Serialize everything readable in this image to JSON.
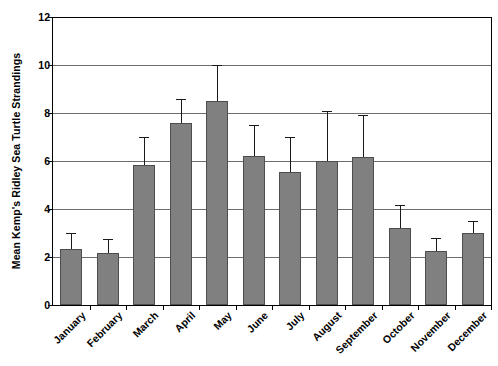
{
  "chart_data": {
    "type": "bar",
    "title": "",
    "xlabel": "",
    "ylabel": "Mean Kemp's Ridley Sea Turtle Strandings",
    "ylim": [
      0,
      12
    ],
    "yticks": [
      0,
      2,
      4,
      6,
      8,
      10,
      12
    ],
    "ytick_labels": [
      "0",
      "2",
      "4",
      "6",
      "8",
      "10",
      "12"
    ],
    "grid": true,
    "legend": "none",
    "error_bars": "upper-only",
    "categories": [
      "January",
      "February",
      "March",
      "April",
      "May",
      "June",
      "July",
      "August",
      "September",
      "October",
      "November",
      "December"
    ],
    "values": [
      2.35,
      2.15,
      5.85,
      7.6,
      8.5,
      6.2,
      5.55,
      6.0,
      6.15,
      3.2,
      2.25,
      3.0
    ],
    "error_upper": [
      3.0,
      2.75,
      7.0,
      8.6,
      10.0,
      7.5,
      7.0,
      8.1,
      7.9,
      4.15,
      2.8,
      3.5
    ],
    "colors": {
      "bar_fill": "#808080",
      "bar_edge": "#4d4d4d",
      "gridline": "#6e6e6e",
      "axis": "#000000",
      "error_bar": "#1a1a1a",
      "background": "#ffffff"
    }
  }
}
